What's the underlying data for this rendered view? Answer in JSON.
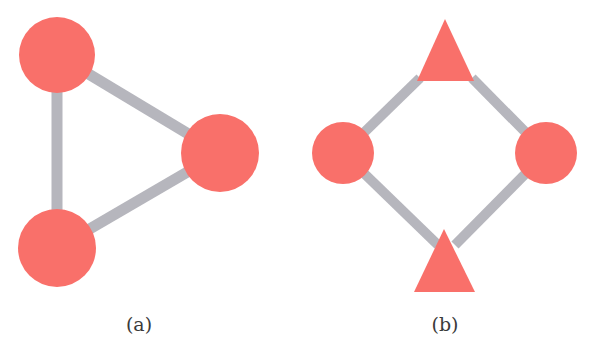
{
  "colors": {
    "node": "#f9706a",
    "edge": "#b6b6bd",
    "background": "#ffffff",
    "text": "#3a3a3a"
  },
  "panels": [
    {
      "label": "(a)",
      "nodes": [
        {
          "id": "a1",
          "shape": "circle",
          "cx": 57,
          "cy": 55,
          "r": 38
        },
        {
          "id": "a2",
          "shape": "circle",
          "cx": 220,
          "cy": 153,
          "r": 39
        },
        {
          "id": "a3",
          "shape": "circle",
          "cx": 57,
          "cy": 248,
          "r": 39
        }
      ],
      "edges": [
        [
          "a1",
          "a2"
        ],
        [
          "a1",
          "a3"
        ],
        [
          "a2",
          "a3"
        ]
      ]
    },
    {
      "label": "(b)",
      "nodes": [
        {
          "id": "b1",
          "shape": "triangle",
          "cx": 445,
          "cy": 50
        },
        {
          "id": "b2",
          "shape": "circle",
          "cx": 343,
          "cy": 153,
          "r": 31
        },
        {
          "id": "b3",
          "shape": "circle",
          "cx": 546,
          "cy": 153,
          "r": 31
        },
        {
          "id": "b4",
          "shape": "triangle",
          "cx": 444,
          "cy": 260
        }
      ],
      "edges": [
        [
          "b1",
          "b2"
        ],
        [
          "b1",
          "b3"
        ],
        [
          "b2",
          "b4"
        ],
        [
          "b3",
          "b4"
        ]
      ]
    }
  ]
}
